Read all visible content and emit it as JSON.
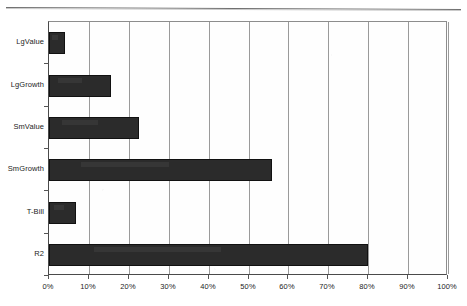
{
  "chart_data": {
    "type": "bar",
    "orientation": "horizontal",
    "title": "",
    "subtitle": "",
    "xlabel": "",
    "ylabel": "",
    "grid": true,
    "legend": false,
    "legend_position": "none",
    "xlim": [
      0,
      100
    ],
    "xunit": "%",
    "bar_color": "#2b2b2b",
    "categories": [
      "LgValue",
      "LgGrowth",
      "SmValue",
      "SmGrowth",
      "T-Bill",
      "R2"
    ],
    "values": [
      4,
      15.5,
      22.5,
      56,
      6.8,
      80
    ],
    "xticks": [
      0,
      10,
      20,
      30,
      40,
      50,
      60,
      70,
      80,
      90,
      100
    ],
    "xticklabels": [
      "0%",
      "10%",
      "20%",
      "30%",
      "40%",
      "50%",
      "60%",
      "70%",
      "80%",
      "90%",
      "100%"
    ]
  },
  "page": {
    "rule_present": true
  }
}
